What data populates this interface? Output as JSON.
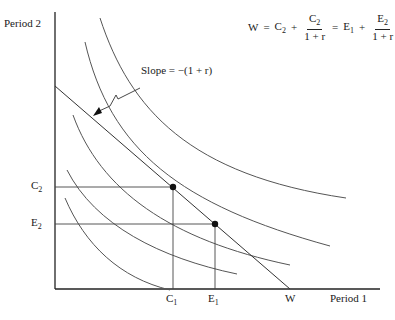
{
  "axes": {
    "y_label": "Period 2",
    "x_label": "Period 1"
  },
  "ticks": {
    "y": [
      {
        "main": "C",
        "sub": "2"
      },
      {
        "main": "E",
        "sub": "2"
      }
    ],
    "x": [
      {
        "main": "C",
        "sub": "1"
      },
      {
        "main": "E",
        "sub": "1"
      },
      {
        "main": "W",
        "sub": ""
      }
    ]
  },
  "equation": {
    "lhs": "W",
    "eq1": "=",
    "t1_main": "C",
    "t1_sub": "2",
    "plus1": "+",
    "f1_num_main": "C",
    "f1_num_sub": "2",
    "f1_den": "1 + r",
    "eq2": "=",
    "t2_main": "E",
    "t2_sub": "1",
    "plus2": "+",
    "f2_num_main": "E",
    "f2_num_sub": "2",
    "f2_den": "1 + r"
  },
  "annotation": {
    "slope_label": "Slope = −(1 + r)"
  },
  "colors": {
    "line": "#333333",
    "curve": "#555555",
    "point": "#111111"
  }
}
